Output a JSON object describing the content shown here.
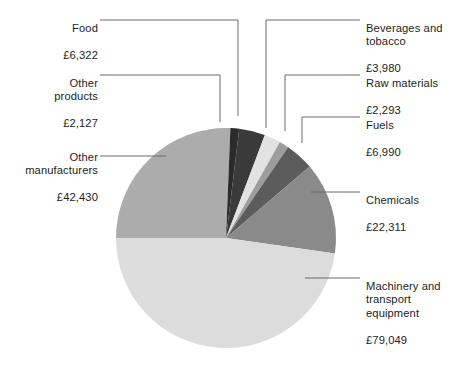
{
  "chart_data": {
    "type": "pie",
    "title": "",
    "subtitle": "",
    "xlabel": "",
    "ylabel": "",
    "currency": "£",
    "total": 165502,
    "legend_position": "callout-labels",
    "grid": false,
    "start_angle_deg": 180,
    "direction": "clockwise",
    "categories": [
      "Other manufacturers",
      "Food",
      "Other products",
      "Beverages and tobacco",
      "Raw materials",
      "Fuels",
      "Chemicals",
      "Machinery and transport equipment"
    ],
    "values": [
      42430,
      6322,
      2127,
      3980,
      2293,
      6990,
      22311,
      79049
    ],
    "slices": [
      {
        "id": "other-manufacturers",
        "label": "Other\nmanufacturers",
        "value_text": "£42,430",
        "value": 42430,
        "color": "#acacac",
        "start_deg": 180,
        "end_deg": 272.3
      },
      {
        "id": "other-products",
        "label": "Other\nproducts",
        "value_text": "£2,127",
        "value": 2127,
        "color": "#2b2b2b",
        "start_deg": 272.3,
        "end_deg": 276.93
      },
      {
        "id": "food",
        "label": "Food",
        "value_text": "£6,322",
        "value": 6322,
        "color": "#3a3a3a",
        "start_deg": 276.93,
        "end_deg": 290.68
      },
      {
        "id": "beverages",
        "label": "Beverages and\ntobacco",
        "value_text": "£3,980",
        "value": 3980,
        "color": "#e2e2e2",
        "start_deg": 290.68,
        "end_deg": 299.34
      },
      {
        "id": "raw-materials",
        "label": "Raw materials",
        "value_text": "£2,293",
        "value": 2293,
        "color": "#9d9d9d",
        "start_deg": 299.34,
        "end_deg": 304.33
      },
      {
        "id": "fuels",
        "label": "Fuels",
        "value_text": "£6,990",
        "value": 6990,
        "color": "#5c5c5c",
        "start_deg": 304.33,
        "end_deg": 319.53
      },
      {
        "id": "chemicals",
        "label": "Chemicals",
        "value_text": "£22,311",
        "value": 22311,
        "color": "#8a8a8a",
        "start_deg": 319.53,
        "end_deg": 368.06
      },
      {
        "id": "machinery",
        "label": "Machinery and\ntransport\nequipment",
        "value_text": "£79,049",
        "value": 79049,
        "color": "#dcdcdc",
        "start_deg": 368.06,
        "end_deg": 540.0
      }
    ],
    "geometry": {
      "center_x": 226,
      "center_y": 238,
      "radius": 110
    },
    "leader_line_color": "#6b6b6b"
  },
  "labels": {
    "food": {
      "name": "Food",
      "value": "£6,322"
    },
    "other_products": {
      "name": "Other\nproducts",
      "value": "£2,127"
    },
    "other_manufacturers": {
      "name": "Other\nmanufacturers",
      "value": "£42,430"
    },
    "beverages": {
      "name": "Beverages and\ntobacco",
      "value": "£3,980"
    },
    "raw_materials": {
      "name": "Raw materials",
      "value": "£2,293"
    },
    "fuels": {
      "name": "Fuels",
      "value": "£6,990"
    },
    "chemicals": {
      "name": "Chemicals",
      "value": "£22,311"
    },
    "machinery": {
      "name": "Machinery and\ntransport\nequipment",
      "value": "£79,049"
    }
  }
}
